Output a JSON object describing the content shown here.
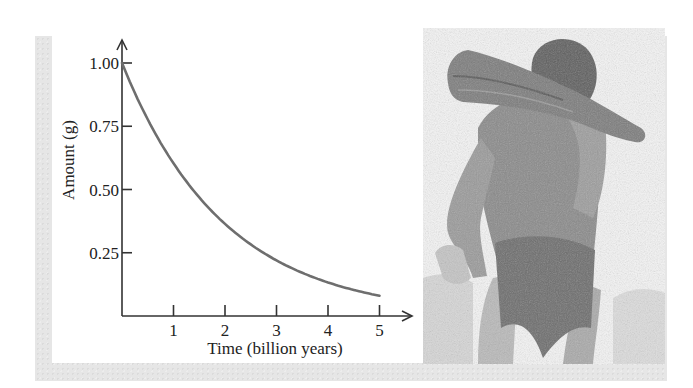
{
  "chart_data": {
    "type": "line",
    "title": "",
    "xlabel": "Time (billion years)",
    "ylabel": "Amount (g)",
    "x_ticks": [
      1,
      2,
      3,
      4,
      5
    ],
    "x_tick_labels": [
      "1",
      "2",
      "3",
      "4",
      "5"
    ],
    "y_ticks": [
      0.25,
      0.5,
      0.75,
      1.0
    ],
    "y_tick_labels": [
      "0.25",
      "0.50",
      "0.75",
      "1.00"
    ],
    "xlim": [
      0,
      5.6
    ],
    "ylim": [
      0,
      1.2
    ],
    "grid": false,
    "legend": null,
    "series": [
      {
        "name": "Amount remaining",
        "color": "#6e6e6e",
        "x": [
          0,
          0.5,
          1,
          1.5,
          2,
          2.5,
          3,
          3.5,
          4,
          4.5,
          5
        ],
        "y": [
          1.0,
          0.78,
          0.61,
          0.47,
          0.37,
          0.29,
          0.22,
          0.17,
          0.14,
          0.11,
          0.08
        ]
      }
    ]
  },
  "illustration": {
    "description": "pencil sketch of a prehistoric man carrying a log on his shoulder"
  },
  "colors": {
    "frame": "#e6e6e6",
    "axis": "#333333",
    "curve": "#6e6e6e"
  }
}
